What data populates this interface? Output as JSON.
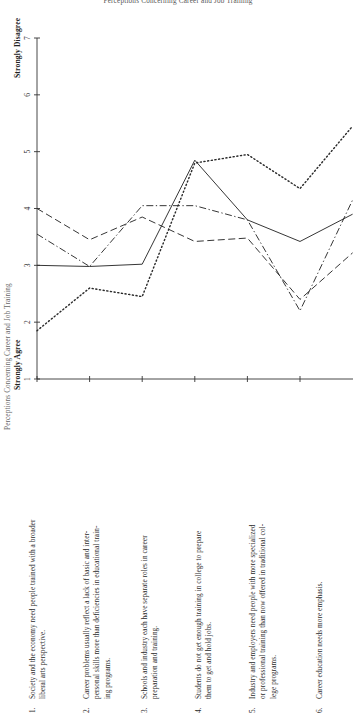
{
  "super_title": "Perceptions Concerning Career and Job Training",
  "axis": {
    "y_title": "Perceptions Concerning Career and Job Training",
    "high_label": "Strongly Disagree",
    "low_label": "Strongly Agree",
    "y_ticks": [
      "1",
      "2",
      "3",
      "4",
      "5",
      "6",
      "7"
    ]
  },
  "items": [
    {
      "num": "1.",
      "lines": [
        "Society and the economy need people trained with a broader",
        "liberal arts perspective."
      ],
      "text": "Society and the economy need people trained with a broader liberal arts perspective."
    },
    {
      "num": "2.",
      "lines": [
        "Career problems usually reflect a lack of basic and inter-",
        "personal skills more than deficiencies in educational train-",
        "ing programs."
      ],
      "text": "Career problems usually reflect a lack of basic and interpersonal skills more than deficiencies in educational training programs."
    },
    {
      "num": "3.",
      "lines": [
        "Schools and industry each have separate roles in career",
        "preparation and training."
      ],
      "text": "Schools and industry each have separate roles in career preparation and training."
    },
    {
      "num": "4.",
      "lines": [
        "Students do not get enough training in college to prepare",
        "them to get and hold jobs."
      ],
      "text": "Students do not get enough training in college to prepare them to get and hold jobs."
    },
    {
      "num": "5.",
      "lines": [
        "Industry and employers need people with more specialized",
        "or professional training than now offered in traditional col-",
        "lege programs."
      ],
      "text": "Industry and employers need people with more specialized or professional training than now offered in traditional college programs."
    },
    {
      "num": "6.",
      "lines": [
        "Career education needs more emphasis."
      ],
      "text": "Career education needs more emphasis."
    }
  ],
  "chart_data": {
    "type": "line",
    "title": "Perceptions Concerning Career and Job Training",
    "xlabel": "",
    "ylabel": "Perceptions Concerning Career and Job Training",
    "ylim": [
      1,
      7
    ],
    "yticks": [
      1,
      2,
      3,
      4,
      5,
      6,
      7
    ],
    "y_axis_low_anchor": "Strongly Agree",
    "y_axis_high_anchor": "Strongly Disagree",
    "grid": false,
    "legend": "none",
    "categories": [
      "1",
      "2",
      "3",
      "4",
      "5",
      "6",
      "7"
    ],
    "category_statements": [
      "Society and the economy need people trained with a broader liberal arts perspective.",
      "Career problems usually reflect a lack of basic and interpersonal skills more than deficiencies in educational training programs.",
      "Schools and industry each have separate roles in career preparation and training.",
      "Students do not get enough training in college to prepare them to get and hold jobs.",
      "Industry and employers need people with more specialized or professional training than now offered in traditional college programs.",
      "Career education needs more emphasis."
    ],
    "series": [
      {
        "name": "Series A",
        "style": "solid",
        "values": [
          3.0,
          2.98,
          3.02,
          4.85,
          3.8,
          3.42,
          3.9
        ]
      },
      {
        "name": "Series B",
        "style": "dashed",
        "values": [
          4.0,
          3.45,
          3.85,
          3.42,
          3.48,
          2.4,
          3.22
        ]
      },
      {
        "name": "Series C",
        "style": "dashdot",
        "values": [
          3.55,
          2.98,
          4.05,
          4.05,
          3.8,
          2.2,
          4.15
        ]
      },
      {
        "name": "Series D",
        "style": "dotted",
        "values": [
          1.85,
          2.6,
          2.45,
          4.8,
          4.95,
          4.35,
          5.45
        ]
      }
    ]
  }
}
